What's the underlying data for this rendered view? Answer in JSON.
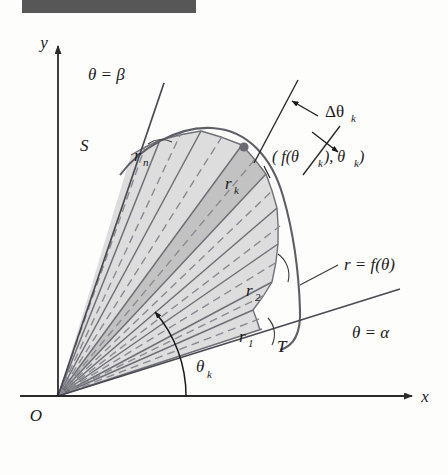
{
  "figure": {
    "title_bar": {
      "name": "redacted-title-bar",
      "color": "#575757"
    },
    "axes": {
      "x_label": "x",
      "y_label": "y",
      "origin_label": "O",
      "axis_color": "#2b2b2b"
    },
    "rays": {
      "alpha_label": "θ = α",
      "beta_label": "θ = β",
      "alpha_degrees": 18,
      "beta_degrees": 76
    },
    "curve": {
      "label": "r = f(θ)",
      "color": "#5e5e66",
      "endpoint_near_beta": "S",
      "endpoint_near_alpha": "T"
    },
    "sector_labels": {
      "r1": "r₁",
      "r1_base": "r",
      "r1_sub": "1",
      "r2_base": "r",
      "r2_sub": "2",
      "rk_base": "r",
      "rk_sub": "k",
      "rn_base": "r",
      "rn_sub": "n"
    },
    "annotations": {
      "delta_theta_base": "Δθ",
      "delta_theta_sub": "k",
      "point_label": "( f(θ",
      "point_label_sub1": "k",
      "point_label_mid": "), θ",
      "point_label_sub2": "k",
      "point_label_end": ")",
      "theta_k_base": "θ",
      "theta_k_sub": "k"
    },
    "colors": {
      "sector_fill_light": "#dddddd",
      "sector_fill_dark": "#c2c2c2",
      "sector_stroke": "#6f6f78",
      "dashed_stroke": "#8a8a93",
      "background": "#fdfdfc"
    },
    "geometry": {
      "origin_x": 58,
      "origin_y": 396,
      "num_sectors": 8,
      "highlighted_sector_index": 5
    }
  }
}
